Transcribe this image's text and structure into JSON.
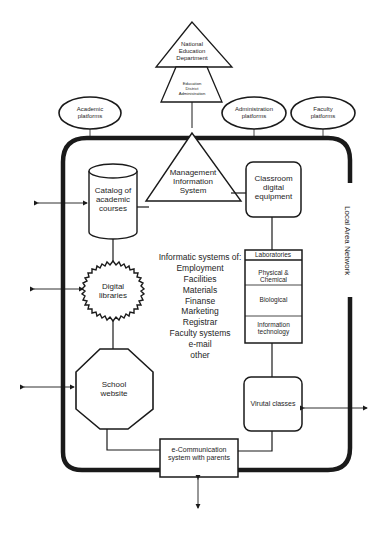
{
  "diagram": {
    "type": "school information system architecture",
    "network_label": "Local Area Network",
    "external": {
      "national": "National Education Department",
      "national_lines": [
        "National",
        "Education",
        "Department"
      ],
      "district_lines": [
        "Education",
        "District",
        "Administration"
      ]
    },
    "platforms": [
      {
        "id": "academic",
        "lines": [
          "Academic",
          "platforms"
        ]
      },
      {
        "id": "administration",
        "lines": [
          "Administration",
          "platforms"
        ]
      },
      {
        "id": "faculty",
        "lines": [
          "Faculty",
          "platforms"
        ]
      }
    ],
    "nodes": {
      "mis_lines": [
        "Management",
        "Information",
        "System"
      ],
      "catalog_lines": [
        "Catalog of",
        "academic",
        "courses"
      ],
      "classroom_lines": [
        "Classroom",
        "digital",
        "equipment"
      ],
      "digital_libraries_lines": [
        "Digital",
        "libraries"
      ],
      "school_website_lines": [
        "School",
        "website"
      ],
      "virtual_classes": "Virutal classes",
      "ecomm_lines": [
        "e-Communication",
        "system with parents"
      ]
    },
    "laboratories": {
      "title": "Laboratories",
      "rows": [
        "Physical & Chemical",
        "Biological",
        "Information technology"
      ],
      "it_lines": [
        "Information",
        "technology"
      ]
    },
    "informatic_systems": {
      "heading": "Informatic systems of:",
      "items": [
        "Employment",
        "Facilities",
        "Materials",
        "Finanse",
        "Marketing",
        "Registrar",
        "Faculty systems",
        "e-mail",
        "other"
      ]
    },
    "colors": {
      "stroke": "#1a1a1a",
      "background": "#ffffff",
      "text": "#1e1e1e"
    }
  }
}
